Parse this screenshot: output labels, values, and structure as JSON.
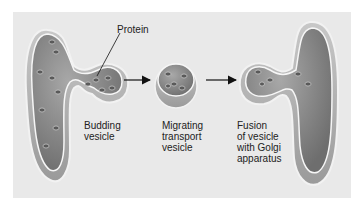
{
  "diagram": {
    "labels": {
      "protein": "Protein",
      "budding": [
        "Budding",
        "vesicle"
      ],
      "migrating": [
        "Migrating",
        "transport",
        "vesicle"
      ],
      "fusion": [
        "Fusion",
        "of vesicle",
        "with Golgi",
        "apparatus"
      ]
    },
    "stages": [
      "Budding vesicle",
      "Migrating transport vesicle",
      "Fusion of vesicle with Golgi apparatus"
    ],
    "colors": {
      "background": "#e9e9e9",
      "membrane_fill": "#8a8a8a",
      "membrane_edge": "#f4f4f4",
      "protein": "#5a5a5a"
    }
  }
}
